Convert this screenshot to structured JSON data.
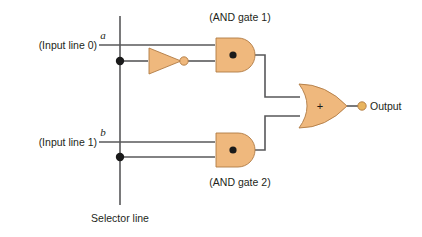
{
  "diagram": {
    "kind": "logic-circuit",
    "title_visible": false,
    "background_color": "#ffffff",
    "gate_fill_color": "#efb87d",
    "gate_stroke_color": "#b07a44",
    "wire_color": "#58585a",
    "text_color": "#231f20",
    "labels": {
      "input_line_0": "(Input line 0)",
      "input_line_1": "(Input line 1)",
      "signal_a": "a",
      "signal_b": "b",
      "and_gate_1": "(AND gate 1)",
      "and_gate_2": "(AND gate 2)",
      "selector_line": "Selector line",
      "output": "Output"
    },
    "gate_symbols": {
      "and_operator": "●",
      "or_operator": "+"
    },
    "icons": {
      "not_gate": "not-gate-icon",
      "and_gate": "and-gate-icon",
      "or_gate": "or-gate-icon",
      "junction": "junction-dot-icon",
      "output_terminal": "output-terminal-icon"
    }
  }
}
